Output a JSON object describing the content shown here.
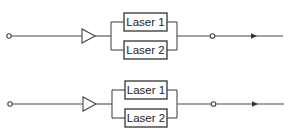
{
  "diagrams": [
    {
      "name": "configuration-top",
      "main_y": 36,
      "lasers": [
        {
          "label": "Laser 1",
          "y_top": 13,
          "y_bot": 31
        },
        {
          "label": "Laser 2",
          "y_top": 41,
          "y_bot": 59
        }
      ]
    },
    {
      "name": "configuration-bottom",
      "main_y": 104,
      "lasers": [
        {
          "label": "Laser 1",
          "y_top": 81,
          "y_bot": 99
        },
        {
          "label": "Laser 2",
          "y_top": 109,
          "y_bot": 127
        }
      ]
    }
  ],
  "colors": {
    "line": "#4a4a4a",
    "background": "#ffffff"
  }
}
